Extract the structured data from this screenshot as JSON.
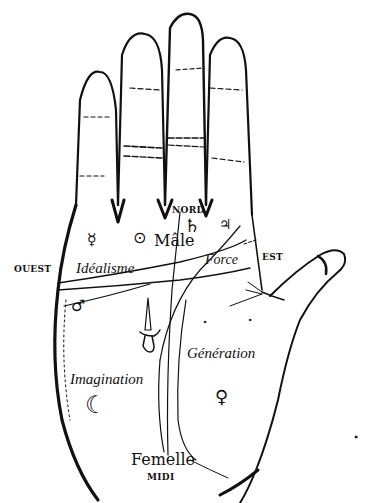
{
  "diagram": {
    "directions": {
      "north": "NORD",
      "south": "MIDI",
      "east": "EST",
      "west": "OUEST"
    },
    "regions": {
      "idealism": "Idéalisme",
      "force": "Force",
      "generation": "Génération",
      "imagination": "Imagination",
      "male": "Mâle",
      "female": "Femelle"
    },
    "symbols": {
      "mercury": "☿",
      "sun": "⊙",
      "saturn": "♄",
      "jupiter": "♃",
      "mars": "♂",
      "moon": "☾",
      "venus": "♀"
    },
    "colors": {
      "ink": "#111111",
      "paper": "#ffffff"
    }
  }
}
